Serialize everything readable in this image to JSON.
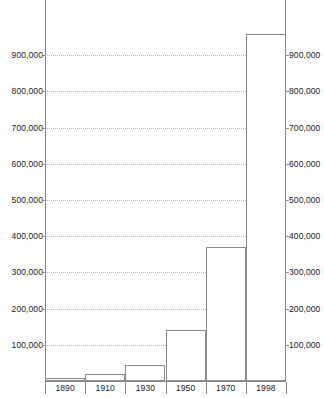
{
  "chart_data": {
    "type": "bar",
    "title": "",
    "subtitle": "",
    "xlabel": "",
    "ylabel": "",
    "categories": [
      "1890",
      "1910",
      "1930",
      "1950",
      "1970",
      "1998"
    ],
    "values": [
      8000,
      18000,
      45000,
      140000,
      370000,
      958000
    ],
    "series": [
      {
        "name": "Population",
        "values": [
          8000,
          18000,
          45000,
          140000,
          370000,
          958000
        ]
      }
    ],
    "ylim": [
      0,
      1000000
    ],
    "ytick_values": [
      100000,
      200000,
      300000,
      400000,
      500000,
      600000,
      700000,
      800000,
      900000
    ],
    "ytick_labels": [
      "100,000",
      "200,000",
      "300,000",
      "400,000",
      "500,000",
      "600,000",
      "700,000",
      "800,000",
      "900,000"
    ],
    "ytick_labels_right": [
      "100,000",
      "200,000",
      "300,000",
      "400,000",
      "500,000",
      "600,000",
      "700,000",
      "800,000",
      "900,000"
    ],
    "grid": true,
    "grid_style": "dotted",
    "grid_axis": "y",
    "legend": false,
    "legend_position": "none",
    "annotations": [],
    "colors": {
      "bar_fill": "#ffffff",
      "bar_stroke": "#8a8a8a",
      "gridline": "#b4b4b4",
      "axis": "#8a8a8a",
      "text": "#1a1a1a",
      "background": "#ffffff"
    }
  }
}
